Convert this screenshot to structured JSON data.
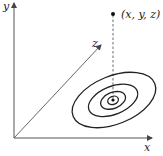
{
  "diagram": {
    "axes": {
      "x_label": "x",
      "y_label": "y",
      "z_label": "z"
    },
    "point": {
      "label": "(x, y, z)"
    },
    "contours": {
      "count": 4,
      "has_center_dot": true
    },
    "colors": {
      "line": "#222222",
      "axis": "#555555",
      "background": "#ffffff"
    }
  }
}
